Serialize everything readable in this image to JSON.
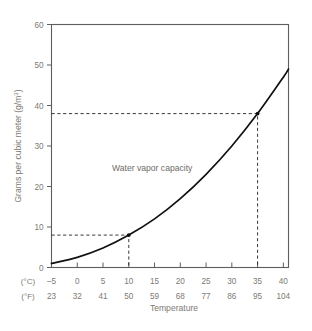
{
  "chart_data": {
    "type": "line",
    "title": "",
    "xlabel": "Temperature",
    "ylabel": "Grams per cubic meter (g/m³)",
    "series_label": "Water vapor capacity",
    "xlim_c": [
      -5,
      41
    ],
    "ylim": [
      0,
      60
    ],
    "grid": false,
    "legend": "none",
    "x_axis_units": [
      "(°C)",
      "(°F)"
    ],
    "x_ticks_c": [
      -5,
      0,
      5,
      10,
      15,
      20,
      25,
      30,
      35,
      40
    ],
    "x_ticks_f": [
      23,
      32,
      41,
      50,
      59,
      68,
      77,
      86,
      95,
      104
    ],
    "y_ticks": [
      0,
      10,
      20,
      30,
      40,
      50,
      60
    ],
    "x": [
      -5,
      0,
      5,
      10,
      15,
      20,
      25,
      30,
      35,
      40,
      41
    ],
    "values": [
      1.0,
      2.5,
      4.8,
      8.0,
      12.0,
      17.0,
      23.0,
      30.0,
      38.0,
      47.0,
      49.0
    ],
    "annotations": [
      {
        "name": "guide-low",
        "x_c": 10,
        "x_f": 50,
        "y": 8
      },
      {
        "name": "guide-high",
        "x_c": 35,
        "x_f": 95,
        "y": 38
      }
    ],
    "colors": {
      "curve": "#111111",
      "guide": "#222222",
      "frame": "#5f5e5c",
      "text": "#7d7a74",
      "background": "#ffffff"
    }
  }
}
